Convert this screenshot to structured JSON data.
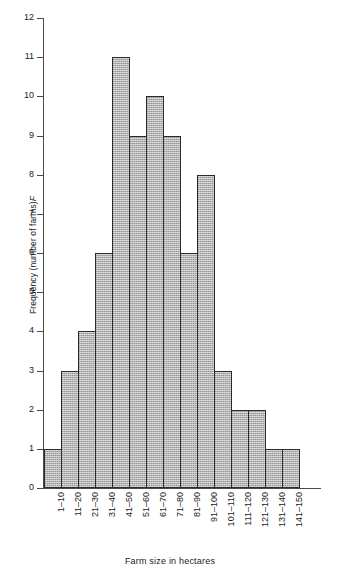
{
  "chart_data": {
    "type": "bar",
    "title": "",
    "xlabel": "Farm size in hectares",
    "ylabel": "Frequency (number of farms) F",
    "ylabel_plain": "Frequency (number of farms)",
    "ylabel_symbol": "F",
    "categories": [
      "1–10",
      "11–20",
      "21–30",
      "31–40",
      "41–50",
      "51–60",
      "61–70",
      "71–80",
      "81–90",
      "91–100",
      "101–110",
      "111–120",
      "121–130",
      "131–140",
      "141–150"
    ],
    "values": [
      1,
      3,
      4,
      6,
      11,
      9,
      10,
      9,
      6,
      8,
      3,
      2,
      2,
      1,
      1
    ],
    "ylim": [
      0,
      12
    ],
    "ytick_labels": [
      "0",
      "1",
      "2",
      "3",
      "4",
      "5",
      "6",
      "7",
      "8",
      "9",
      "10",
      "11",
      "12"
    ],
    "yticks": [
      0,
      1,
      2,
      3,
      4,
      5,
      6,
      7,
      8,
      9,
      10,
      11,
      12
    ],
    "grid": false,
    "legend": null,
    "bar_gap": 0,
    "colors": {
      "bar_fill": "#b2b2b2",
      "bar_border": "#2b2b2b",
      "axis": "#4a4a4a",
      "text": "#1a1a1a",
      "background": "#ffffff"
    }
  }
}
